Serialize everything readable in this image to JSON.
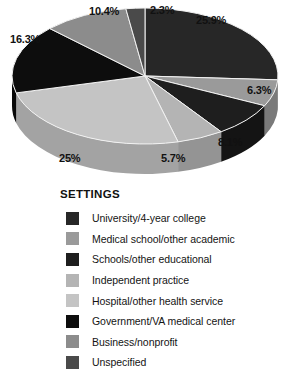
{
  "chart_data": {
    "type": "pie",
    "title": "SETTINGS",
    "three_d": true,
    "start_angle_deg": -90,
    "direction": "clockwise",
    "categories": [
      "University/4-year college",
      "Medical school/other academic",
      "Schools/other educational",
      "Independent practice",
      "Hospital/other health service",
      "Government/VA medical center",
      "Business/nonprofit",
      "Unspecified"
    ],
    "values": [
      25.9,
      6.3,
      8.1,
      5.7,
      25,
      16.3,
      10.4,
      2.3
    ],
    "labels": [
      "25.9%",
      "6.3%",
      "8.1%",
      "5.7%",
      "25%",
      "16.3%",
      "10.4%",
      "2.3%"
    ],
    "colors": [
      "#272727",
      "#9a9a9a",
      "#1e1e1e",
      "#b4b4b4",
      "#c4c4c4",
      "#0d0d0d",
      "#8c8c8c",
      "#4a4a4a"
    ],
    "side_colors": [
      "#1a1a1a",
      "#7a7a7a",
      "#141414",
      "#949494",
      "#a3a3a3",
      "#080808",
      "#6e6e6e",
      "#343434"
    ],
    "xlabel": "",
    "ylabel": "",
    "legend_position": "bottom",
    "grid": false
  },
  "legend": {
    "title": "SETTINGS",
    "items": [
      {
        "label": "University/4-year college",
        "color": "#272727"
      },
      {
        "label": "Medical school/other academic",
        "color": "#9a9a9a"
      },
      {
        "label": "Schools/other educational",
        "color": "#1e1e1e"
      },
      {
        "label": "Independent practice",
        "color": "#b4b4b4"
      },
      {
        "label": "Hospital/other health service",
        "color": "#c4c4c4"
      },
      {
        "label": "Government/VA medical center",
        "color": "#0d0d0d"
      },
      {
        "label": "Business/nonprofit",
        "color": "#8c8c8c"
      },
      {
        "label": "Unspecified",
        "color": "#4a4a4a"
      }
    ]
  },
  "slice_labels": [
    {
      "text": "25.9%",
      "left": 196,
      "top": 14
    },
    {
      "text": "6.3%",
      "left": 247,
      "top": 84
    },
    {
      "text": "8.1%",
      "left": 218,
      "top": 136
    },
    {
      "text": "5.7%",
      "left": 161,
      "top": 152
    },
    {
      "text": "25%",
      "left": 59,
      "top": 152
    },
    {
      "text": "16.3%",
      "left": 10,
      "top": 33
    },
    {
      "text": "10.4%",
      "left": 89,
      "top": 5
    },
    {
      "text": "2.3%",
      "left": 150,
      "top": 4
    }
  ]
}
